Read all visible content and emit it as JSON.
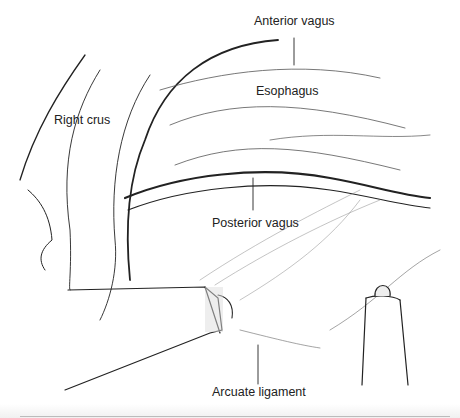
{
  "figure": {
    "labels": {
      "anterior_vagus": "Anterior vagus",
      "esophagus": "Esophagus",
      "right_crus": "Right crus",
      "posterior_vagus": "Posterior vagus",
      "arcuate_ligament": "Arcuate ligament"
    },
    "colors": {
      "ink": "#222222",
      "background": "#ffffff",
      "shade": "#777777"
    }
  }
}
